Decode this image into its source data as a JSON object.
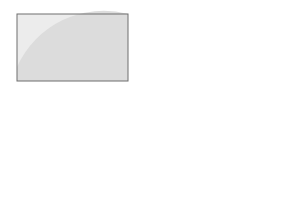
{
  "diagram": {
    "type": "drill-diagram",
    "field": {
      "x": 16,
      "y": 14,
      "width": 111,
      "height": 67,
      "background": "#e6e6e6",
      "border": "#6e6e6e",
      "shaded_half_circle": "#d4d4d4"
    },
    "colors": {
      "line": "#3a3a3a",
      "arrow_fill": "#8c8c8c",
      "arrow_outline": "#3a3a3a",
      "cloud": "#ffffff",
      "dashed": "#9a9a9a",
      "ball": "#1a1a1a"
    },
    "elements": {
      "clouds": 2,
      "birds": 3,
      "horizontal_arrows_left": 4,
      "vertical_arrows_down_left_column": 4,
      "vertical_arrows_up_right_column": 5,
      "players_bottom_row": 4,
      "balls": 4,
      "loops_center": 4
    }
  }
}
